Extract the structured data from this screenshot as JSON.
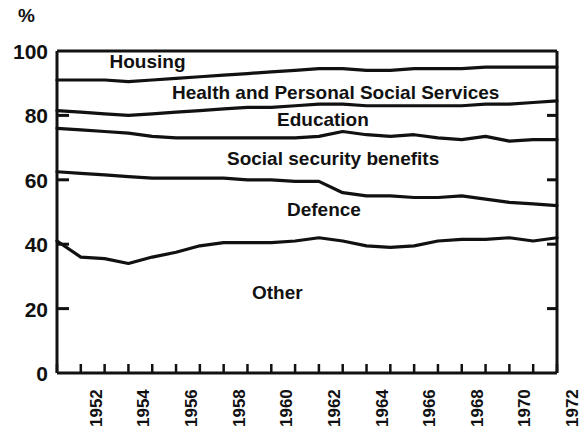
{
  "chart_data": {
    "type": "area",
    "title": "",
    "subtitle": "",
    "xlabel": "",
    "ylabel": "%",
    "ylim": [
      0,
      100
    ],
    "xlim": [
      1951,
      1972
    ],
    "grid": false,
    "legend_position": "inline-annotations",
    "y_ticks": [
      0,
      20,
      40,
      60,
      80,
      100
    ],
    "y_tick_labels": [
      "0",
      "20",
      "40",
      "60",
      "80",
      "100"
    ],
    "x_ticks": [
      1951,
      1952,
      1953,
      1954,
      1955,
      1956,
      1957,
      1958,
      1959,
      1960,
      1961,
      1962,
      1963,
      1964,
      1965,
      1966,
      1967,
      1968,
      1969,
      1970,
      1971,
      1972
    ],
    "x_tick_labels_shown": [
      "1952",
      "1954",
      "1956",
      "1958",
      "1960",
      "1962",
      "1964",
      "1966",
      "1968",
      "1970",
      "1972"
    ],
    "x": [
      1951,
      1952,
      1953,
      1954,
      1955,
      1956,
      1957,
      1958,
      1959,
      1960,
      1961,
      1962,
      1963,
      1964,
      1965,
      1966,
      1967,
      1968,
      1969,
      1970,
      1971,
      1972
    ],
    "note": "Cumulative (stacked) boundary lines read off the chart, in percent of total expenditure. Bands from bottom up: Other, Defence, Social security benefits, Education, Health and Personal Social Services, Housing.",
    "boundaries": [
      {
        "name": "Other / Defence boundary",
        "values": [
          41,
          36,
          35.5,
          34,
          36,
          37.5,
          39.5,
          40.5,
          40.5,
          40.5,
          41,
          42,
          41,
          39.5,
          39,
          39.5,
          41,
          41.5,
          41.5,
          42,
          41,
          42
        ]
      },
      {
        "name": "Defence / Social security benefits boundary",
        "values": [
          62.5,
          62,
          61.5,
          61,
          60.5,
          60.5,
          60.5,
          60.5,
          60,
          60,
          59.5,
          59.5,
          56,
          55,
          55,
          54.5,
          54.5,
          55,
          54,
          53,
          52.5,
          52
        ]
      },
      {
        "name": "Social security benefits / Education boundary",
        "values": [
          76,
          75.5,
          75,
          74.5,
          73.5,
          73,
          73,
          73,
          73,
          73,
          73,
          73.5,
          75,
          74,
          73.5,
          74,
          73,
          72.5,
          73.5,
          72,
          72.5,
          72.5
        ]
      },
      {
        "name": "Education / Health and Personal Social Services boundary",
        "values": [
          81.5,
          81,
          80.5,
          80,
          80.5,
          81,
          81.5,
          82,
          82.5,
          82.5,
          83,
          83.5,
          83.5,
          83,
          83,
          83,
          83,
          83,
          83.5,
          83.5,
          84,
          84.5
        ]
      },
      {
        "name": "Health and Personal Social Services / Housing boundary",
        "values": [
          91,
          91,
          91,
          90.5,
          91,
          91.5,
          92,
          92.5,
          93,
          93.5,
          94,
          94.5,
          94.5,
          94,
          94,
          94.5,
          94.5,
          94.5,
          95,
          95,
          95,
          95
        ]
      },
      {
        "name": "Housing top (100%)",
        "values": [
          100,
          100,
          100,
          100,
          100,
          100,
          100,
          100,
          100,
          100,
          100,
          100,
          100,
          100,
          100,
          100,
          100,
          100,
          100,
          100,
          100,
          100
        ]
      }
    ],
    "band_labels": [
      {
        "label": "Housing",
        "x_pct": 10.5,
        "y_pct": 96.5
      },
      {
        "label": "Health and Personal Social Services",
        "x_pct": 23.0,
        "y_pct": 87.0
      },
      {
        "label": "Education",
        "x_pct": 44.0,
        "y_pct": 78.5
      },
      {
        "label": "Social security benefits",
        "x_pct": 34.0,
        "y_pct": 66.5
      },
      {
        "label": "Defence",
        "x_pct": 46.0,
        "y_pct": 50.5
      },
      {
        "label": "Other",
        "x_pct": 39.0,
        "y_pct": 25.0
      }
    ]
  },
  "axis": {
    "unit_symbol": "%"
  }
}
